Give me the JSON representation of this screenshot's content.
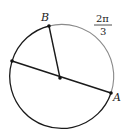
{
  "diagram": {
    "circle": {
      "cx": 60,
      "cy": 78,
      "r": 52,
      "stroke": "#1a1a1a",
      "arc_highlight_stroke": "#8a8a8a"
    },
    "center": {
      "x": 60,
      "y": 78
    },
    "points": {
      "B": {
        "label": "B",
        "x": 49,
        "y": 26
      },
      "A": {
        "label": "A",
        "x": 111,
        "y": 93
      },
      "D": {
        "label": "",
        "x": 12,
        "y": 61
      }
    },
    "arc_label": {
      "numerator": "2π",
      "denominator": "3"
    }
  }
}
